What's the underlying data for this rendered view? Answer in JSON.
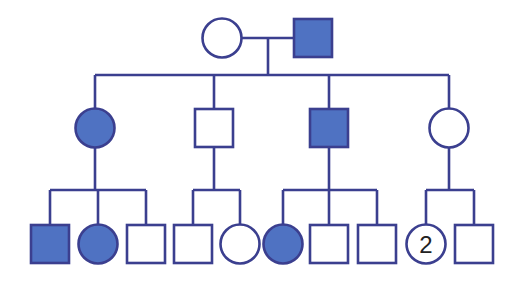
{
  "diagram": {
    "type": "pedigree",
    "colors": {
      "line": "#3b3f8f",
      "affected_fill": "#4f72c2",
      "unaffected_fill": "#ffffff",
      "background": "#ffffff"
    },
    "generations": [
      {
        "label": "I",
        "individuals": [
          {
            "id": "I-1",
            "sex": "female",
            "affected": false,
            "cx": 222,
            "cy": 38
          },
          {
            "id": "I-2",
            "sex": "male",
            "affected": true,
            "cx": 313,
            "cy": 38
          }
        ]
      },
      {
        "label": "II",
        "individuals": [
          {
            "id": "II-1",
            "sex": "female",
            "affected": true,
            "cx": 95,
            "cy": 128
          },
          {
            "id": "II-2",
            "sex": "male",
            "affected": false,
            "cx": 214,
            "cy": 128
          },
          {
            "id": "II-3",
            "sex": "male",
            "affected": true,
            "cx": 329,
            "cy": 128
          },
          {
            "id": "II-4",
            "sex": "female",
            "affected": false,
            "cx": 449,
            "cy": 128
          }
        ]
      },
      {
        "label": "III",
        "individuals": [
          {
            "id": "III-1",
            "sex": "male",
            "affected": true,
            "cx": 50,
            "cy": 244,
            "parent": "II-1"
          },
          {
            "id": "III-2",
            "sex": "female",
            "affected": true,
            "cx": 98,
            "cy": 244,
            "parent": "II-1"
          },
          {
            "id": "III-3",
            "sex": "male",
            "affected": false,
            "cx": 146,
            "cy": 244,
            "parent": "II-1"
          },
          {
            "id": "III-4",
            "sex": "male",
            "affected": false,
            "cx": 193,
            "cy": 244,
            "parent": "II-2"
          },
          {
            "id": "III-5",
            "sex": "female",
            "affected": false,
            "cx": 240,
            "cy": 244,
            "parent": "II-2"
          },
          {
            "id": "III-6",
            "sex": "female",
            "affected": true,
            "cx": 283,
            "cy": 244,
            "parent": "II-3"
          },
          {
            "id": "III-7",
            "sex": "male",
            "affected": false,
            "cx": 329,
            "cy": 244,
            "parent": "II-3"
          },
          {
            "id": "III-8",
            "sex": "male",
            "affected": false,
            "cx": 377,
            "cy": 244,
            "parent": "II-3"
          },
          {
            "id": "III-9",
            "sex": "female",
            "affected": false,
            "cx": 426,
            "cy": 244,
            "parent": "II-4",
            "count_label": "2"
          },
          {
            "id": "III-10",
            "sex": "male",
            "affected": false,
            "cx": 474,
            "cy": 244,
            "parent": "II-4"
          }
        ]
      }
    ]
  }
}
